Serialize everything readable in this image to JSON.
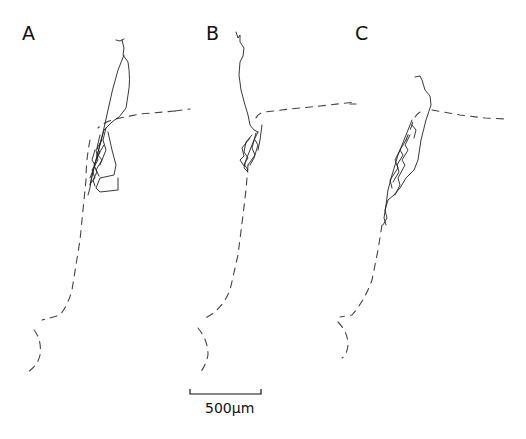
{
  "figure": {
    "panels": [
      {
        "id": "A",
        "label": "A"
      },
      {
        "id": "B",
        "label": "B"
      },
      {
        "id": "C",
        "label": "C"
      }
    ],
    "scale_bar": {
      "label": "500μm",
      "length_px": 70
    },
    "colors": {
      "background": "#ffffff",
      "trace": "#222222",
      "boundary_dashed": "#444444"
    }
  }
}
